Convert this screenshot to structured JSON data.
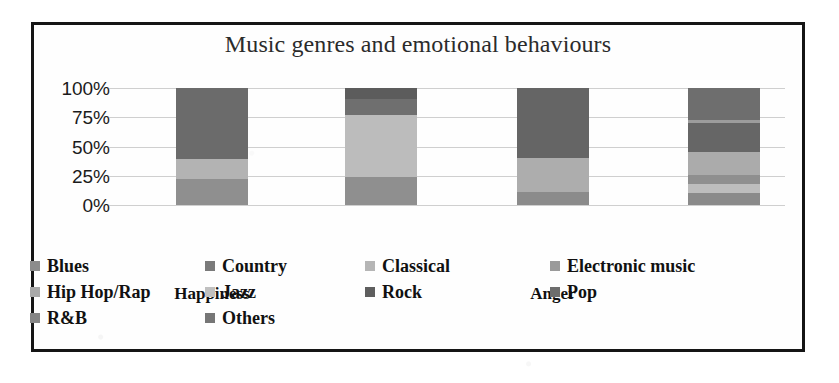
{
  "frame": {
    "border_color": "#151515"
  },
  "chart_data": {
    "type": "bar",
    "subtype": "100% stacked column",
    "title": "Music genres and emotional behaviours",
    "xlabel": "",
    "ylabel": "",
    "ylim": [
      0,
      100
    ],
    "grid": true,
    "legend_position": "bottom",
    "tick_labels": [
      "100%",
      "75%",
      "50%",
      "25%",
      "0%"
    ],
    "tick_values": [
      100,
      75,
      50,
      25,
      0
    ],
    "categories": [
      "Happiness",
      "",
      "Anger",
      ""
    ],
    "visible_category_labels": [
      "Happiness",
      "Anger"
    ],
    "series": [
      {
        "name": "Blues",
        "color": "#8c8c8c",
        "values": [
          0,
          0,
          0,
          0
        ]
      },
      {
        "name": "Country",
        "color": "#7a7a7a",
        "values": [
          0,
          0,
          0,
          0
        ]
      },
      {
        "name": "Classical",
        "color": "#b5b5b5",
        "values": [
          0,
          0,
          0,
          0
        ]
      },
      {
        "name": "Electronic music",
        "color": "#9a9a9a",
        "values": [
          0,
          0,
          0,
          0
        ]
      },
      {
        "name": "Hip Hop/Rap",
        "color": "#a9a9a9",
        "values": [
          0,
          0,
          0,
          0
        ]
      },
      {
        "name": "Jazz",
        "color": "#c0c0c0",
        "values": [
          0,
          0,
          0,
          0
        ]
      },
      {
        "name": "Rock",
        "color": "#5e5e5e",
        "values": [
          0,
          0,
          0,
          0
        ]
      },
      {
        "name": "Pop",
        "color": "#6d6d6d",
        "values": [
          0,
          0,
          0,
          0
        ]
      },
      {
        "name": "R&B",
        "color": "#858585",
        "values": [
          0,
          0,
          0,
          0
        ]
      },
      {
        "name": "Others",
        "color": "#767676",
        "values": [
          0,
          0,
          0,
          0
        ]
      }
    ],
    "bars": [
      {
        "category": "Happiness",
        "x_px": 173,
        "stack": [
          {
            "label": "bottom",
            "percent": 22.5,
            "color": "#8f8f8f"
          },
          {
            "label": "middle",
            "percent": 16.5,
            "color": "#b3b3b3"
          },
          {
            "label": "top",
            "percent": 61.0,
            "color": "#6b6b6b"
          }
        ]
      },
      {
        "category": "",
        "x_px": 342,
        "stack": [
          {
            "label": "bottom",
            "percent": 24.0,
            "color": "#8f8f8f"
          },
          {
            "label": "middle",
            "percent": 53.0,
            "color": "#bcbcbc"
          },
          {
            "label": "upper",
            "percent": 14.0,
            "color": "#6f6f6f"
          },
          {
            "label": "top",
            "percent": 9.0,
            "color": "#5c5c5c"
          }
        ]
      },
      {
        "category": "Anger",
        "x_px": 514,
        "stack": [
          {
            "label": "bottom",
            "percent": 11.0,
            "color": "#8b8b8b"
          },
          {
            "label": "middle",
            "percent": 29.0,
            "color": "#adadad"
          },
          {
            "label": "top",
            "percent": 60.0,
            "color": "#656565"
          }
        ]
      },
      {
        "category": "",
        "x_px": 685,
        "stack": [
          {
            "label": "s1",
            "percent": 10.0,
            "color": "#8a8a8a"
          },
          {
            "label": "s2",
            "percent": 8.0,
            "color": "#bdbdbd"
          },
          {
            "label": "s3",
            "percent": 8.0,
            "color": "#8f8f8f"
          },
          {
            "label": "s4",
            "percent": 19.0,
            "color": "#ababab"
          },
          {
            "label": "s5",
            "percent": 25.0,
            "color": "#666666"
          },
          {
            "label": "s6",
            "percent": 3.0,
            "color": "#9c9c9c"
          },
          {
            "label": "s7",
            "percent": 27.0,
            "color": "#6e6e6e"
          }
        ]
      }
    ],
    "legend": [
      {
        "label": "Blues",
        "color": "#8c8c8c"
      },
      {
        "label": "Country",
        "color": "#7a7a7a"
      },
      {
        "label": "Classical",
        "color": "#b5b5b5"
      },
      {
        "label": "Electronic music",
        "color": "#9a9a9a"
      },
      {
        "label": "Hip Hop/Rap",
        "color": "#a9a9a9"
      },
      {
        "label": "Jazz",
        "color": "#c0c0c0"
      },
      {
        "label": "Rock",
        "color": "#5e5e5e"
      },
      {
        "label": "Pop",
        "color": "#6d6d6d"
      },
      {
        "label": "R&B",
        "color": "#858585"
      },
      {
        "label": "Others",
        "color": "#767676"
      }
    ]
  }
}
